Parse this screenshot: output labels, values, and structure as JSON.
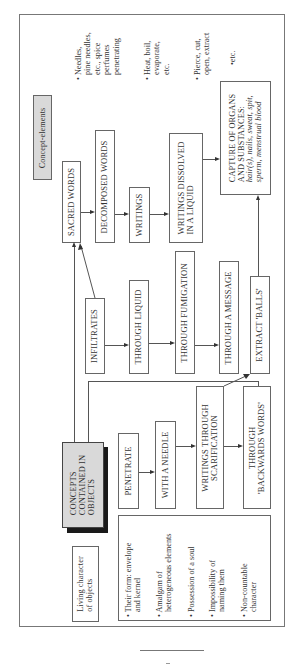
{
  "diagram": {
    "orientation": "rotated-90-ccw",
    "header_label": "Concept-elements",
    "root": {
      "label_lines": [
        "CONCEPTS",
        "CONTAINED IN",
        "OBJECTS"
      ]
    },
    "living_label_lines": [
      "Living character",
      "of objects"
    ],
    "living_bullets": [
      [
        "• Their form: envelope",
        "and kernel"
      ],
      [
        "• Amalgam of",
        "heterogeneous elements"
      ],
      [
        "• Possession of a soul"
      ],
      [
        "• Impossibility of",
        "naming them"
      ],
      [
        "• Non-countable",
        "character"
      ]
    ],
    "row_words": {
      "nodes": [
        {
          "id": "sacred",
          "label": "SACRED WORDS"
        },
        {
          "id": "decomposed",
          "label": "DECOMPOSED WORDS"
        },
        {
          "id": "writings",
          "label": "WRITINGS"
        },
        {
          "id": "dissolved",
          "label_lines": [
            "WRITINGS DISSOLVED",
            "IN A LIQUID"
          ]
        }
      ]
    },
    "row_infiltrates": {
      "nodes": [
        {
          "id": "infiltrates",
          "label": "INFILTRATES"
        },
        {
          "id": "liquid",
          "label": "THROUGH LIQUID"
        },
        {
          "id": "fumigation",
          "label": "THROUGH FUMIGATION"
        },
        {
          "id": "message",
          "label": "THROUGH A MESSAGE"
        },
        {
          "id": "extract",
          "label": "EXTRACT 'BALLS'"
        }
      ]
    },
    "row_penetrate": {
      "nodes": [
        {
          "id": "penetrate",
          "label": "PENETRATE"
        },
        {
          "id": "needle",
          "label": "WITH A NEEDLE"
        },
        {
          "id": "scarification",
          "label_lines": [
            "WRITINGS THROUGH",
            "SCARIFICATION"
          ]
        },
        {
          "id": "backwards",
          "label_lines": [
            "THROUGH",
            "'BACKWARDS WORDS'"
          ]
        }
      ]
    },
    "capture": {
      "title_lines": [
        "CAPTURE OF ORGANS",
        "AND SUBSTANCES:"
      ],
      "italic_lines": [
        "hair(s), nails, sweat, spit,",
        "sperm, menstrual blood"
      ]
    },
    "side_notes": [
      [
        "• Needles,",
        "pine needles,",
        "etc., spice",
        "perfumes",
        "penetrating"
      ],
      [
        "• Heat, boil,",
        "evaporate,",
        "etc."
      ],
      [
        "• Pierce, cut,",
        "open, extract"
      ],
      [
        "•etc."
      ]
    ],
    "edges": [
      [
        "root",
        "sacred"
      ],
      [
        "infiltrates",
        "sacred"
      ],
      [
        "root",
        "penetrate-row"
      ],
      [
        "sacred",
        "decomposed"
      ],
      [
        "decomposed",
        "writings"
      ],
      [
        "writings",
        "dissolved"
      ],
      [
        "dissolved",
        "capture"
      ],
      [
        "infiltrates",
        "liquid"
      ],
      [
        "liquid",
        "fumigation"
      ],
      [
        "fumigation",
        "message"
      ],
      [
        "penetrate",
        "needle"
      ],
      [
        "needle",
        "scarification"
      ],
      [
        "scarification",
        "backwards"
      ],
      [
        "scarification",
        "extract"
      ],
      [
        "extract",
        "capture"
      ]
    ]
  },
  "footer": {
    "rule": true
  }
}
